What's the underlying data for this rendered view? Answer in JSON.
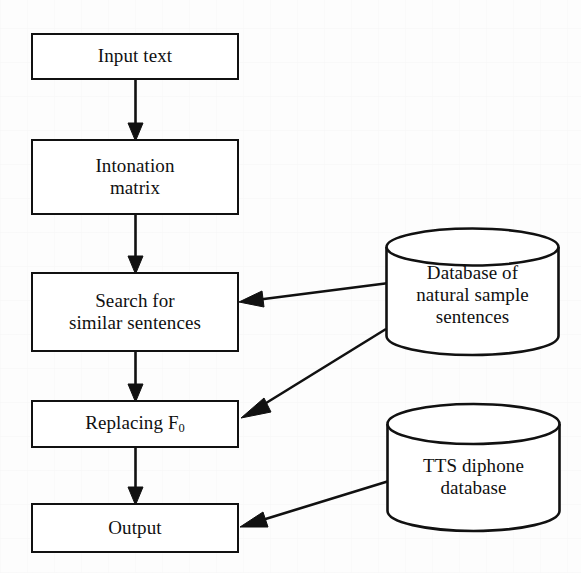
{
  "diagram": {
    "type": "flowchart",
    "background_color": "#fdfdfd",
    "line_color": "#111111",
    "text_color": "#101010",
    "nodes": [
      {
        "id": "input-text",
        "shape": "rectangle",
        "label": "Input text",
        "x": 31,
        "y": 33,
        "w": 208,
        "h": 47
      },
      {
        "id": "intonation-matrix",
        "shape": "rectangle",
        "label": "Intonation\nmatrix",
        "x": 31,
        "y": 139,
        "w": 208,
        "h": 76
      },
      {
        "id": "search-similar-sentences",
        "shape": "rectangle",
        "label": "Search for\nsimilar sentences",
        "x": 31,
        "y": 272,
        "w": 208,
        "h": 80
      },
      {
        "id": "replacing-f0",
        "shape": "rectangle",
        "label": "Replacing F0",
        "label_base": "Replacing F",
        "label_sub": "0",
        "x": 31,
        "y": 400,
        "w": 208,
        "h": 48
      },
      {
        "id": "output",
        "shape": "rectangle",
        "label": "Output",
        "x": 31,
        "y": 503,
        "w": 208,
        "h": 50
      },
      {
        "id": "database-natural-sample-sentences",
        "shape": "cylinder",
        "label": "Database of\nnatural sample\nsentences",
        "x": 384,
        "y": 228,
        "w": 177,
        "h": 127
      },
      {
        "id": "tts-diphone-database",
        "shape": "cylinder",
        "label": "TTS diphone\ndatabase",
        "x": 385,
        "y": 403,
        "w": 177,
        "h": 130
      }
    ],
    "edges": [
      {
        "id": "input-to-intonation",
        "from": "input-text",
        "to": "intonation-matrix",
        "style": "vertical-arrow"
      },
      {
        "id": "intonation-to-search",
        "from": "intonation-matrix",
        "to": "search-similar-sentences",
        "style": "vertical-arrow"
      },
      {
        "id": "search-to-replacing",
        "from": "search-similar-sentences",
        "to": "replacing-f0",
        "style": "vertical-arrow"
      },
      {
        "id": "replacing-to-output",
        "from": "replacing-f0",
        "to": "output",
        "style": "vertical-arrow"
      },
      {
        "id": "sentencedb-to-search",
        "from": "database-natural-sample-sentences",
        "to": "search-similar-sentences",
        "style": "diagonal-arrow"
      },
      {
        "id": "sentencedb-to-replacing",
        "from": "database-natural-sample-sentences",
        "to": "replacing-f0",
        "style": "diagonal-arrow"
      },
      {
        "id": "diphonedb-to-output",
        "from": "tts-diphone-database",
        "to": "output",
        "style": "diagonal-arrow"
      }
    ]
  }
}
